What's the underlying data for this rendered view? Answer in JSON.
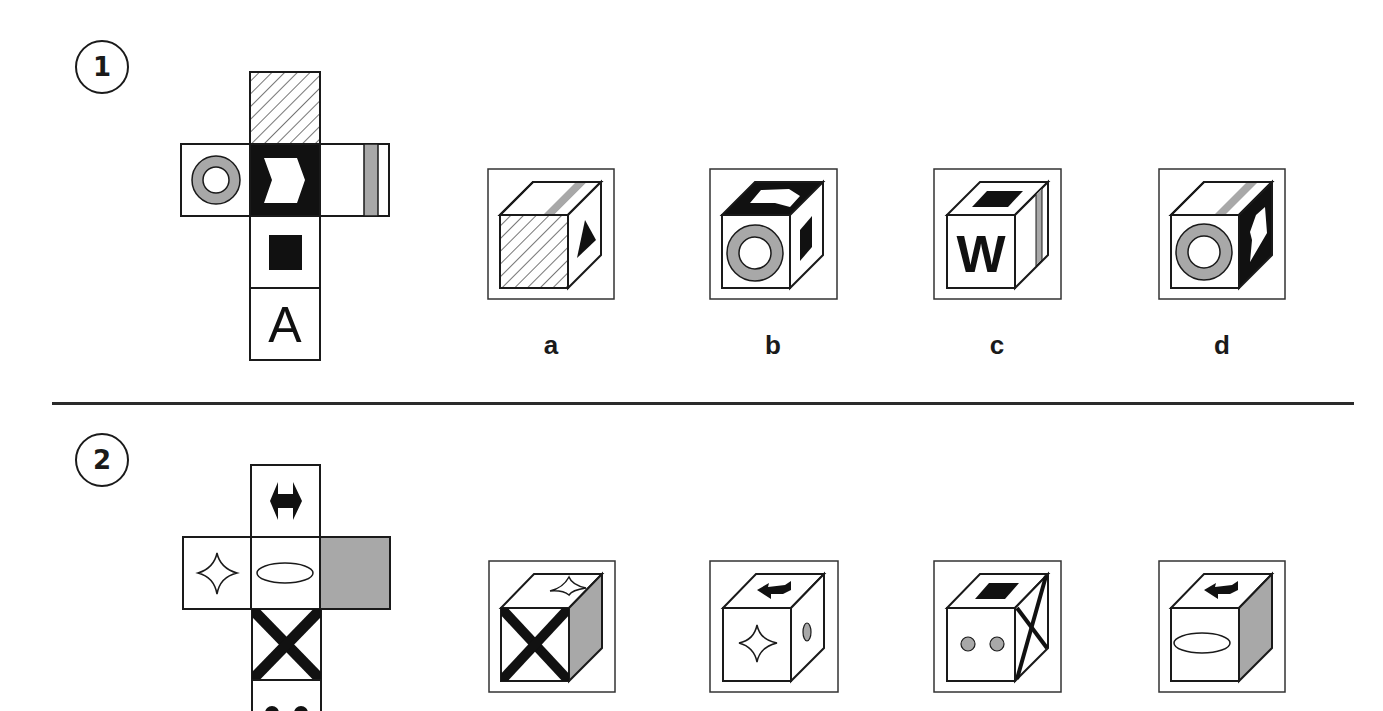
{
  "questions": [
    {
      "number": "1",
      "net": {
        "faces": {
          "top": "diagonal-hatch",
          "left": "grey-ring",
          "center": "white-chevron-on-black",
          "right": "grey-vertical-stripe",
          "below": "black-square",
          "bottom": "letter-A"
        },
        "letter": "A"
      },
      "options": [
        {
          "label": "a",
          "front": "diagonal-hatch",
          "top": "grey-stripe",
          "side": "black-triangle"
        },
        {
          "label": "b",
          "front": "grey-ring",
          "top": "white-chevron-on-black",
          "side": "black-square"
        },
        {
          "label": "c",
          "front": "letter-W",
          "top": "black-square",
          "side": "grey-vertical-stripe",
          "letter": "W"
        },
        {
          "label": "d",
          "front": "grey-ring",
          "top": "grey-stripe",
          "side": "white-chevron-on-black"
        }
      ]
    },
    {
      "number": "2",
      "net": {
        "faces": {
          "top": "black-double-arrow",
          "left": "four-point-star",
          "center": "ellipse",
          "right": "grey-fill",
          "below": "black-x",
          "bottom": "two-grey-dots"
        }
      },
      "options": [
        {
          "label": "",
          "front": "black-x",
          "top": "four-point-star",
          "side": "grey-fill"
        },
        {
          "label": "",
          "front": "four-point-star",
          "top": "black-arrow",
          "side": "grey-oval"
        },
        {
          "label": "",
          "front": "two-grey-dots",
          "top": "black-square",
          "side": "black-x"
        },
        {
          "label": "",
          "front": "ellipse",
          "top": "black-arrow",
          "side": "grey-fill"
        }
      ]
    }
  ],
  "colors": {
    "ink": "#1a1a1a",
    "grey": "#a8a8a8",
    "background": "#ffffff"
  }
}
